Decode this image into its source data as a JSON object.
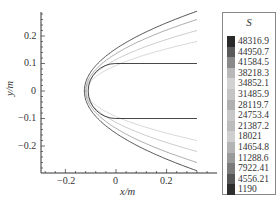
{
  "chart_data": {
    "type": "contour",
    "title": "",
    "xlabel": "x/m",
    "ylabel": "y/m",
    "xlim": [
      -0.3,
      0.32
    ],
    "ylim": [
      -0.3,
      0.3
    ],
    "x_ticks": [
      -0.2,
      0,
      0.2
    ],
    "x_tick_labels": [
      "−0.2",
      "0",
      "0.2"
    ],
    "y_ticks": [
      0.2,
      0.1,
      0,
      -0.1,
      -0.2
    ],
    "y_tick_labels": [
      "0.2",
      "0.1",
      "0",
      "−0.1",
      "−0.2"
    ],
    "grid": false,
    "legend_position": "right",
    "legend": {
      "title": "S",
      "levels": [
        48316.9,
        44950.7,
        41584.5,
        38218.3,
        34852.1,
        31485.9,
        28119.7,
        24753.4,
        21387.2,
        18021,
        14654.8,
        11288.6,
        7922.41,
        4556.21,
        1190
      ],
      "labels": [
        "48316.9",
        "44950.7",
        "41584.5",
        "38218.3",
        "34852.1",
        "31485.9",
        "28119.7",
        "24753.4",
        "21387.2",
        "18021",
        "14654.8",
        "11288.6",
        "7922.41",
        "4556.21",
        "1190"
      ],
      "colors": [
        "#2a2a2a",
        "#5a5a5a",
        "#8a8a8a",
        "#b8b8b8",
        "#d2d2d2",
        "#c4c4c4",
        "#b0b0b0",
        "#c8c8c8",
        "#bcbcbc",
        "#cfcfcf",
        "#b4b4b4",
        "#9a9a9a",
        "#7a7a7a",
        "#555555",
        "#2e2e2e"
      ]
    },
    "body": {
      "description": "blunt-nosed flat-plate body, plates at y=±0.1 m extending from x≈−0.1 to x≈0.32 m, rounded nose at x≈−0.11 m",
      "nose_x": -0.11,
      "plate_y": [
        0.1,
        -0.1
      ],
      "plate_x_end": 0.32
    },
    "shock_lines": [
      {
        "label": "outer shock",
        "standoff_x": -0.125,
        "y_at_x_end": 0.29
      },
      {
        "label": "contour 2",
        "standoff_x": -0.12,
        "y_at_x_end": 0.26
      },
      {
        "label": "contour 3",
        "standoff_x": -0.118,
        "y_at_x_end": 0.22
      },
      {
        "label": "contour 4",
        "standoff_x": -0.116,
        "y_at_x_end": 0.18
      }
    ]
  }
}
